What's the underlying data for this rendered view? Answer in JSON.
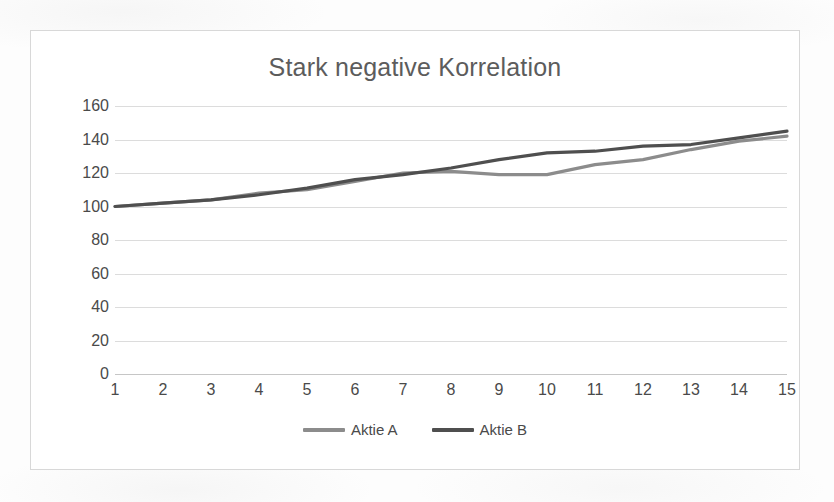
{
  "chart_data": {
    "type": "line",
    "title": "Stark negative Korrelation",
    "xlabel": "",
    "ylabel": "",
    "x": [
      1,
      2,
      3,
      4,
      5,
      6,
      7,
      8,
      9,
      10,
      11,
      12,
      13,
      14,
      15
    ],
    "categories": [
      "1",
      "2",
      "3",
      "4",
      "5",
      "6",
      "7",
      "8",
      "9",
      "10",
      "11",
      "12",
      "13",
      "14",
      "15"
    ],
    "series": [
      {
        "name": "Aktie A",
        "color": "#8c8c8c",
        "values": [
          100,
          102,
          104,
          108,
          110,
          115,
          120,
          121,
          119,
          119,
          125,
          128,
          134,
          139,
          142
        ]
      },
      {
        "name": "Aktie B",
        "color": "#4f4f4f",
        "values": [
          100,
          102,
          104,
          107,
          111,
          116,
          119,
          123,
          128,
          132,
          133,
          136,
          137,
          141,
          145
        ]
      }
    ],
    "ylim": [
      0,
      160
    ],
    "yticks": [
      0,
      20,
      40,
      60,
      80,
      100,
      120,
      140,
      160
    ],
    "ytick_labels": [
      "0",
      "20",
      "40",
      "60",
      "80",
      "100",
      "120",
      "140",
      "160"
    ],
    "grid": true,
    "legend_position": "bottom",
    "legend_entries": [
      "Aktie A",
      "Aktie B"
    ]
  },
  "colors": {
    "series_a": "#8c8c8c",
    "series_b": "#4f4f4f",
    "gridline": "#dcdcdc",
    "frame_border": "#d8d8d8",
    "title_text": "#5c5c5c",
    "tick_text": "#4a4a4a",
    "plot_background": "#ffffff"
  }
}
